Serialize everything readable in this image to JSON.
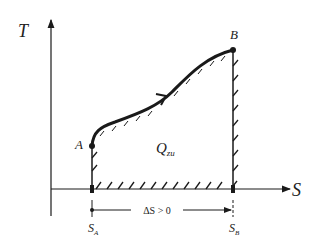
{
  "diagram": {
    "type": "T-S diagram",
    "axes": {
      "y_label": "T",
      "x_label": "S"
    },
    "points": {
      "start": "A",
      "end": "B"
    },
    "area_label": {
      "main": "Q",
      "sub": "zu"
    },
    "ticks": {
      "left": "S",
      "left_sub": "A",
      "right": "S",
      "right_sub": "B"
    },
    "delta_label": "ΔS > 0",
    "colors": {
      "ink": "#1a1a1a",
      "background": "#ffffff"
    }
  }
}
